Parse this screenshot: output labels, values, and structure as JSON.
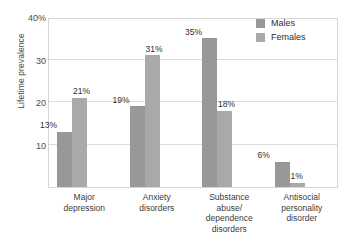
{
  "chart_data": {
    "type": "bar",
    "title": "",
    "xlabel": "",
    "ylabel": "Lifetime prevalence",
    "ylim": [
      0,
      40
    ],
    "yticks": [
      {
        "value": 40,
        "label": "40%"
      },
      {
        "value": 30,
        "label": "30"
      },
      {
        "value": 20,
        "label": "20"
      },
      {
        "value": 10,
        "label": "10"
      }
    ],
    "grid": true,
    "legend_position": "top-right",
    "categories": [
      "Major\ndepression",
      "Anxiety\ndisorders",
      "Substance\nabuse/\ndependence\ndisorders",
      "Antisocial\npersonality\ndisorder"
    ],
    "category_lines": [
      [
        "Major",
        "depression"
      ],
      [
        "Anxiety",
        "disorders"
      ],
      [
        "Substance",
        "abuse/",
        "dependence",
        "disorders"
      ],
      [
        "Antisocial",
        "personality",
        "disorder"
      ]
    ],
    "series": [
      {
        "name": "Males",
        "color": "#989898",
        "values": [
          13,
          19,
          35,
          6
        ],
        "labels": [
          "13%",
          "19%",
          "35%",
          "6%"
        ]
      },
      {
        "name": "Females",
        "color": "#a9a9a9",
        "values": [
          21,
          31,
          18,
          1
        ],
        "labels": [
          "21%",
          "31%",
          "18%",
          "1%"
        ]
      }
    ]
  },
  "legend": {
    "items": [
      {
        "label": "Males",
        "color": "#989898"
      },
      {
        "label": "Females",
        "color": "#a9a9a9"
      }
    ]
  },
  "colors": {
    "males": "#989898",
    "females": "#a9a9a9",
    "grid": "#dcdcdc",
    "frame": "#d6d6d6",
    "text": "#3a3a3a"
  }
}
